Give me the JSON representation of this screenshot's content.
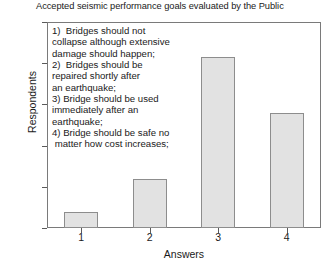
{
  "chart_data": {
    "type": "bar",
    "title": "Accepted seismic performance goals evaluated by the Public",
    "xlabel": "Answers",
    "ylabel": "Respondents",
    "categories": [
      "1",
      "2",
      "3",
      "4"
    ],
    "values": [
      38,
      120,
      415,
      280
    ],
    "ylim": [
      0,
      500
    ],
    "yticks": [
      "0",
      "100",
      "200",
      "300",
      "400",
      "500"
    ],
    "grid": false,
    "legend": "none",
    "bar_fill_color": "#e2e2e2",
    "bar_border_color": "#8d8d8d",
    "annotation": "1)  Bridges should not\ncollapse although extensive\ndamage should happen;\n2)  Bridges should be\nrepaired shortly after\nan earthquake;\n3) Bridge should be used\nimmediately after an\nearthquake;\n4) Bridge should be safe no\n matter how cost increases;"
  }
}
